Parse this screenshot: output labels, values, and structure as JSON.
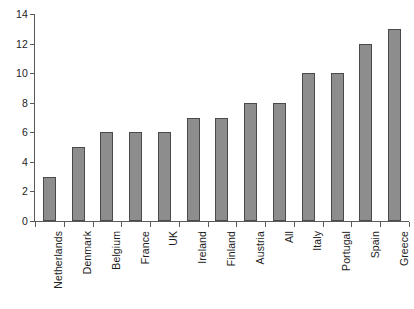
{
  "chart_data": {
    "type": "bar",
    "title": "",
    "subtitle": "",
    "xlabel": "",
    "ylabel": "",
    "ylim": [
      0,
      14
    ],
    "grid": false,
    "legend": false,
    "categories": [
      "Netherlands",
      "Denmark",
      "Belgium",
      "France",
      "UK",
      "Ireland",
      "Finland",
      "Austria",
      "All",
      "Italy",
      "Portugal",
      "Spain",
      "Greece"
    ],
    "values": [
      3,
      5,
      6,
      6,
      6,
      7,
      7,
      8,
      8,
      10,
      10,
      12,
      13
    ],
    "y_ticks": [
      0,
      2,
      4,
      6,
      8,
      10,
      12,
      14
    ],
    "y_tick_labels": [
      "0",
      "2",
      "4",
      "6",
      "8",
      "10",
      "12",
      "14"
    ],
    "colors": {
      "bar_fill": "#8d8d8d",
      "bar_border": "#4a4a4a",
      "axis": "#5a5a5a",
      "text": "#1d1d1d",
      "background": "#ffffff"
    }
  }
}
